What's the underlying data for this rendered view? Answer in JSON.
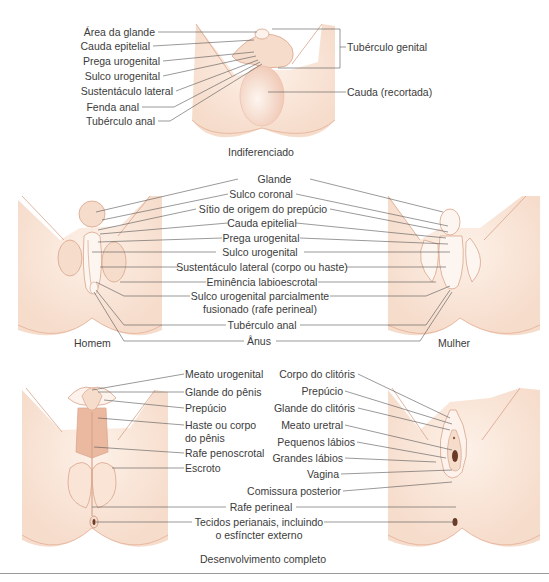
{
  "colors": {
    "skin": "#f9e4d6",
    "skin_light": "#fdf3ec",
    "skin_shadow": "#f2cdb9",
    "outline": "#d9a38a",
    "dark_tissue": "#ebb8a0",
    "leader_line": "#555555",
    "text": "#3b3b3b"
  },
  "sections": {
    "indifferent": {
      "caption": "Indiferenciado",
      "left_labels": [
        "Área da glande",
        "Cauda epitelial",
        "Prega urogenital",
        "Sulco urogenital",
        "Sustentáculo lateral",
        "Fenda anal",
        "Tubérculo anal"
      ],
      "right_labels": [
        "Tubérculo genital",
        "Cauda (recortada)"
      ]
    },
    "intermediate": {
      "left_caption": "Homem",
      "right_caption": "Mulher",
      "center_labels": [
        "Glande",
        "Sulco coronal",
        "Sítio de origem do prepúcio",
        "Cauda epitelial",
        "Prega urogenital",
        "Sulco urogenital",
        "Sustentáculo lateral (corpo ou haste)",
        "Eminência labioescrotal",
        "Sulco urogenital parcialmente",
        "fusionado (rafe perineal)",
        "Tubérculo anal",
        "Ânus"
      ]
    },
    "complete": {
      "caption": "Desenvolvimento completo",
      "male_labels": [
        "Meato urogenital",
        "Glande do pênis",
        "Prepúcio",
        "Haste ou corpo",
        "do pênis",
        "Rafe penoscrotal",
        "Escroto"
      ],
      "female_labels": [
        "Corpo do clitóris",
        "Prepúcio",
        "Glande do clitóris",
        "Meato uretral",
        "Pequenos lábios",
        "Grandes lábios",
        "Vagina",
        "Comissura posterior"
      ],
      "shared_labels": [
        "Rafe perineal",
        "Tecidos perianais, incluindo",
        "o esfíncter externo"
      ]
    }
  }
}
